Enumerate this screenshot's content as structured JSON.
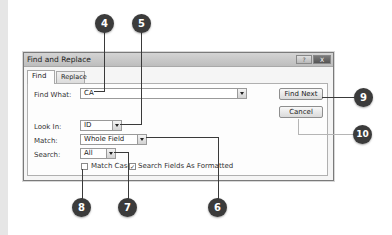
{
  "dialog": {
    "title": "Find and Replace",
    "titlebar_buttons": {
      "help": {
        "label": "?",
        "icon": "help-icon"
      },
      "close": {
        "label": "X",
        "icon": "close-icon"
      }
    },
    "tabs": [
      {
        "label": "Find",
        "active": true
      },
      {
        "label": "Replace",
        "active": false
      }
    ],
    "find_what": {
      "label": "Find What:",
      "value": "CA"
    },
    "look_in": {
      "label": "Look In:",
      "value": "ID"
    },
    "match": {
      "label": "Match:",
      "value": "Whole Field"
    },
    "search": {
      "label": "Search:",
      "value": "All"
    },
    "checkboxes": {
      "match_case": {
        "label": "Match Case",
        "checked": false,
        "mark": ""
      },
      "search_formatted": {
        "label": "Search Fields As Formatted",
        "checked": true,
        "mark": "✓"
      }
    },
    "buttons": {
      "find_next": "Find Next",
      "cancel": "Cancel"
    }
  },
  "callouts": [
    {
      "number": "4",
      "target": "find-what-field"
    },
    {
      "number": "5",
      "target": "look-in-select"
    },
    {
      "number": "6",
      "target": "match-select"
    },
    {
      "number": "7",
      "target": "search-select"
    },
    {
      "number": "8",
      "target": "match-case-checkbox"
    },
    {
      "number": "9",
      "target": "find-next-button"
    },
    {
      "number": "10",
      "target": "cancel-button"
    }
  ],
  "colors": {
    "callout": "#3b3b3b",
    "dialog_bg": "#f5f5f5",
    "titlebar": "#c8c8c8"
  }
}
